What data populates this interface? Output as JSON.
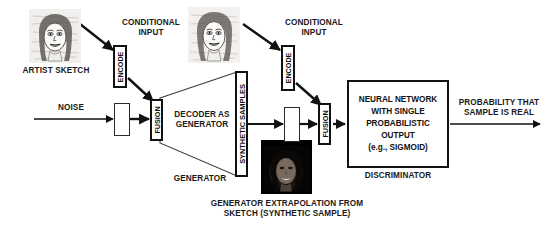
{
  "diagram": {
    "colors": {
      "stroke": "#111111",
      "text": "#1a1a1a",
      "background": "#ffffff",
      "sketch_bg": "#efeeec",
      "synthetic_bg": "#000000"
    },
    "labels": {
      "artist_sketch": "ARTIST SKETCH",
      "conditional_input_1": "CONDITIONAL\nINPUT",
      "conditional_input_2": "CONDITIONAL\nINPUT",
      "encode_1": "ENCODE",
      "encode_2": "ENCODE",
      "noise": "NOISE",
      "fusion_1": "FUSION",
      "fusion_2": "FUSION",
      "decoder_as_generator": "DECODER AS\nGENERATOR",
      "generator": "GENERATOR",
      "synthetic_samples": "SYNTHETIC SAMPLES",
      "discriminator_body": "NEURAL NETWORK\nWITH SINGLE\nPROBABILISTIC\nOUTPUT\n(e.g., SIGMOID)",
      "discriminator": "DISCRIMINATOR",
      "probability_output": "PROBABILITY THAT\nSAMPLE IS REAL",
      "generator_extrapolation": "GENERATOR EXTRAPOLATION FROM\nSKETCH (SYNTHETIC SAMPLE)"
    },
    "images": {
      "artist_sketch_thumb": "pencil-sketch-portrait-smiling-woman",
      "conditional_sketch_thumb": "pencil-sketch-portrait-smiling-woman",
      "synthetic_sample_thumb": "dark-generated-portrait-smiling-woman"
    },
    "icons": {
      "arrow": "arrow-right-icon",
      "diagonal_arrow": "arrow-diagonal-down-right-icon"
    }
  }
}
